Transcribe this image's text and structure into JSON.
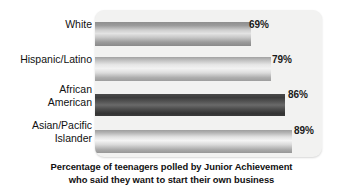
{
  "chart_data": {
    "type": "bar",
    "orientation": "horizontal",
    "title": "",
    "categories": [
      "White",
      "Hispanic/Latino",
      "African\nAmerican",
      "Asian/Pacific\nIslander"
    ],
    "values": [
      69,
      79,
      86,
      89
    ],
    "value_labels": [
      "69%",
      "79%",
      "86%",
      "89%"
    ],
    "unit": "%",
    "xlabel": "",
    "ylabel": "",
    "xlim": [
      0,
      100
    ],
    "grid": false,
    "legend": "none",
    "caption_line_1": "Percentage of teenagers polled by Junior Achievement",
    "caption_line_2": "who said they want to start their own business",
    "bar_colors": [
      "#c8c8c8",
      "#e2e2e2",
      "#4d4d4d",
      "#dcdcdc"
    ],
    "panel_color": "#f2f2f1",
    "background_color": "#ffffff",
    "text_color": "#111111"
  },
  "caption": {
    "line1": "Percentage of teenagers polled by Junior Achievement",
    "line2": "who said they want to start their own business"
  },
  "categories": {
    "c0": "White",
    "c1": "Hispanic/Latino",
    "c2": "African\nAmerican",
    "c3": "Asian/Pacific\nIslander"
  },
  "values": {
    "v0": "69%",
    "v1": "79%",
    "v2": "86%",
    "v3": "89%"
  }
}
